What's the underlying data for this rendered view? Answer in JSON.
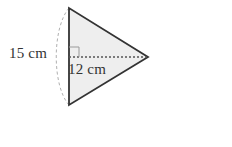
{
  "problem": {
    "type": "geometry-area-problem",
    "shape": "triangle",
    "figure": {
      "side_label": "15 cm",
      "height_label": "12 cm",
      "right_angle_marker": true,
      "arc_marker": true,
      "fill_color": "#eeeeee",
      "stroke_color": "#333333",
      "guide_color": "#9a9a9a"
    },
    "answer": {
      "arrow_icon": "right-arrow-icon",
      "value": "",
      "unit_text": "(cm",
      "unit_exponent": "2",
      "unit_close": ")"
    }
  }
}
